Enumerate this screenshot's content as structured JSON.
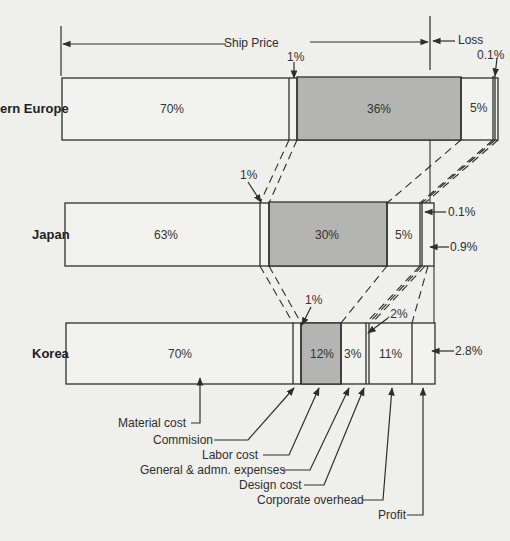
{
  "header": {
    "ship_price_label": "Ship Price",
    "loss_label": "Loss"
  },
  "rows": [
    {
      "country": "Western Europe",
      "country_visible": "ern Europe",
      "segments": [
        {
          "name": "Material cost",
          "label": "70%"
        },
        {
          "name": "Commision",
          "label": "1%"
        },
        {
          "name": "Labor cost",
          "label": "36%"
        },
        {
          "name": "General & admn. expenses",
          "label": "5%"
        },
        {
          "name": "Design cost",
          "label": "0.1%"
        }
      ]
    },
    {
      "country": "Japan",
      "segments": [
        {
          "name": "Material cost",
          "label": "63%"
        },
        {
          "name": "Commision",
          "label": "1%"
        },
        {
          "name": "Labor cost",
          "label": "30%"
        },
        {
          "name": "General & admn. expenses",
          "label": "5%"
        },
        {
          "name": "Design cost",
          "label": "0.1%"
        },
        {
          "name": "Profit",
          "label": "0.9%"
        }
      ]
    },
    {
      "country": "Korea",
      "segments": [
        {
          "name": "Material cost",
          "label": "70%"
        },
        {
          "name": "Commision",
          "label": "1%"
        },
        {
          "name": "Labor cost",
          "label": "12%"
        },
        {
          "name": "General & admn. expenses",
          "label": "3%"
        },
        {
          "name": "Design cost",
          "label": ".2%"
        },
        {
          "name": "Corporate overhead",
          "label": "11%"
        },
        {
          "name": "Profit",
          "label": "2.8%"
        }
      ]
    }
  ],
  "legend": [
    "Material cost",
    "Commision",
    "Labor cost",
    "General & admn. expenses",
    "Design cost",
    "Corporate overhead",
    "Profit"
  ],
  "colors": {
    "background": "#efefec",
    "labor_fill": "#b4b4b2",
    "bar_fill": "#f2f2ef",
    "line": "#2e2e2e"
  }
}
